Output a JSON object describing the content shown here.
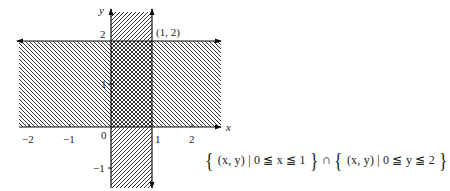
{
  "diagram": {
    "type": "set-region-plot",
    "axes": {
      "x_label": "x",
      "y_label": "y",
      "x_ticks": [
        {
          "value": -2,
          "label": "−2"
        },
        {
          "value": -1,
          "label": "−1"
        },
        {
          "value": 1,
          "label": "1"
        },
        {
          "value": 2,
          "label": "2"
        }
      ],
      "y_ticks": [
        {
          "value": 2,
          "label": "2"
        },
        {
          "value": 1,
          "label": "1"
        },
        {
          "value": -1,
          "label": "−1"
        }
      ],
      "origin_label": "0"
    },
    "regions": [
      {
        "name": "vertical-strip",
        "condition": "0 ≦ x ≦ 1",
        "hatch": "forward-diagonal"
      },
      {
        "name": "horizontal-strip",
        "condition": "0 ≦ y ≦ 2",
        "hatch": "back-diagonal"
      },
      {
        "name": "intersection",
        "condition": "0 ≦ x ≦ 1 and 0 ≦ y ≦ 2",
        "hatch": "crosshatch"
      }
    ],
    "point_label": "(1, 2)",
    "formula": {
      "left_brace": "{",
      "set1": "(x, y) | 0 ≦ x ≦ 1",
      "right_brace": "}",
      "operator": "∩",
      "set2": "(x, y) | 0 ≦ y ≦ 2"
    }
  }
}
